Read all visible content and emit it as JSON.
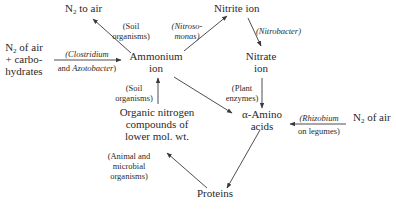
{
  "diagram": {
    "type": "nitrogen-cycle",
    "nodes": {
      "n2_to_air": {
        "main": "N",
        "sub": "2",
        "rest": " to air"
      },
      "nitrite": {
        "label": "Nitrite ion"
      },
      "n2_carbo": {
        "line1_main": "N",
        "line1_sub": "2",
        "line1_rest": " of air",
        "line2": "+ carbo-",
        "line3": "hydrates"
      },
      "ammonium": {
        "line1": "Ammonium",
        "line2": "ion"
      },
      "nitrate": {
        "line1": "Nitrate",
        "line2": "ion"
      },
      "organic": {
        "line1": "Organic nitrogen",
        "line2": "compounds of",
        "line3": "lower mol. wt."
      },
      "amino": {
        "line1": "α-Amino",
        "line2": "acids"
      },
      "n2_air_right": {
        "main": "N",
        "sub": "2",
        "rest": " of air"
      },
      "proteins": {
        "label": "Proteins"
      }
    },
    "edge_labels": {
      "soil_upper": {
        "line1": "(Soil",
        "line2": "organisms)"
      },
      "nitrosomonas": {
        "line1": "(Nitroso-",
        "line2": "monas)"
      },
      "nitrobacter": {
        "label": "(Nitrobacter)"
      },
      "clostridium": {
        "line1": "(Clostridium",
        "line2_plain": "and ",
        "line2_italic": "Azotobacter",
        "line2_end": ")"
      },
      "soil_lower": {
        "line1": "(Soil",
        "line2": "organisms)"
      },
      "plant_enzymes": {
        "line1": "(Plant",
        "line2": "enzymes)"
      },
      "rhizobium": {
        "line1": "(Rhizobium",
        "line2": "on legumes)"
      },
      "animal_microbial": {
        "line1": "(Animal and",
        "line2": "microbial",
        "line3": "organisms)"
      }
    },
    "edges": [
      {
        "from": "ammonium",
        "to": "n2_to_air",
        "label": "soil_upper"
      },
      {
        "from": "ammonium",
        "to": "nitrite",
        "label": "nitrosomonas"
      },
      {
        "from": "nitrite",
        "to": "nitrate",
        "label": "nitrobacter"
      },
      {
        "from": "n2_carbo",
        "to": "ammonium",
        "label": "clostridium"
      },
      {
        "from": "organic",
        "to": "ammonium",
        "label": "soil_lower"
      },
      {
        "from": "nitrate",
        "to": "amino",
        "label": "plant_enzymes"
      },
      {
        "from": "ammonium",
        "to": "amino",
        "label": null
      },
      {
        "from": "n2_air_right",
        "to": "amino",
        "label": "rhizobium"
      },
      {
        "from": "amino",
        "to": "proteins",
        "label": null
      },
      {
        "from": "proteins",
        "to": "organic",
        "label": "animal_microbial"
      }
    ],
    "colors": {
      "text": "#2a2a2a",
      "line": "#3a3a3a",
      "background": "#ffffff"
    }
  }
}
